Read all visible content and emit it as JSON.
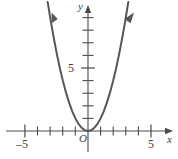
{
  "figure": {
    "title": "",
    "origin_label": "O",
    "x_axis_label": "x",
    "y_axis_label": "y",
    "x_tick_label_left": "–5",
    "x_tick_label_right": "5",
    "y_tick_label": "5"
  },
  "chart_data": {
    "type": "line",
    "title": "",
    "subtitle": "",
    "xlabel": "x",
    "ylabel": "y",
    "xlim": [
      -6.2,
      6.2
    ],
    "ylim": [
      -0.8,
      11.2
    ],
    "grid": false,
    "legend": null,
    "x_ticks": [
      -5,
      -4,
      -3,
      -2,
      -1,
      0,
      1,
      2,
      3,
      4,
      5
    ],
    "x_tick_labels": [
      "–5",
      "",
      "",
      "",
      "",
      "",
      "",
      "",
      "",
      "",
      "5"
    ],
    "y_ticks": [
      1,
      2,
      3,
      4,
      5,
      6,
      7,
      8,
      9,
      10
    ],
    "y_tick_labels": [
      "",
      "",
      "",
      "",
      "5",
      "",
      "",
      "",
      "",
      ""
    ],
    "annotations": [
      "O"
    ],
    "series": [
      {
        "name": "y = x^2",
        "equation": "y = x^2",
        "x": [
          -3.2,
          -3.0,
          -2.75,
          -2.5,
          -2.25,
          -2.0,
          -1.75,
          -1.5,
          -1.25,
          -1.0,
          -0.75,
          -0.5,
          -0.25,
          0,
          0.25,
          0.5,
          0.75,
          1.0,
          1.25,
          1.5,
          1.75,
          2.0,
          2.25,
          2.5,
          2.75,
          3.0,
          3.2
        ],
        "values": [
          10.24,
          9.0,
          7.5625,
          6.25,
          5.0625,
          4.0,
          3.0625,
          2.25,
          1.5625,
          1.0,
          0.5625,
          0.25,
          0.0625,
          0,
          0.0625,
          0.25,
          0.5625,
          1.0,
          1.5625,
          2.25,
          3.0625,
          4.0,
          5.0625,
          6.25,
          7.5625,
          9.0,
          10.24
        ],
        "vertex": [
          0,
          0
        ],
        "arrow_ends": [
          "left-up",
          "right-up"
        ],
        "color": "#57565a"
      }
    ],
    "colors": {
      "curve": "#57565a",
      "axis": "#4a4a4a",
      "text": "#3f3f3f",
      "background": "#ffffff"
    }
  }
}
